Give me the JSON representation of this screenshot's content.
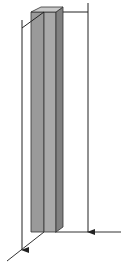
{
  "diagram": {
    "title": "",
    "colors": {
      "background": "#ffffff",
      "face_left": "#9a9a9a",
      "face_front": "#a9a9a9",
      "face_right": "#808080",
      "face_top": "#c8c8c8",
      "edge": "#333333",
      "line": "#222222"
    },
    "labels": []
  }
}
